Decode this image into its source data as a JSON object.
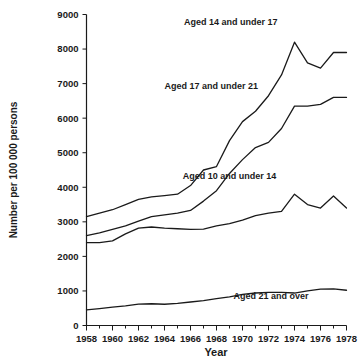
{
  "chart_data": {
    "type": "line",
    "title": "",
    "xlabel": "Year",
    "ylabel": "Number per 100 000 persons",
    "xlim": [
      1958,
      1978
    ],
    "ylim": [
      0,
      9000
    ],
    "grid": false,
    "legend_position": "inline-annotations",
    "x": [
      1958,
      1959,
      1960,
      1961,
      1962,
      1963,
      1964,
      1965,
      1966,
      1967,
      1968,
      1969,
      1970,
      1971,
      1972,
      1973,
      1974,
      1975,
      1976,
      1977,
      1978
    ],
    "xticks_major": [
      1958,
      1960,
      1962,
      1964,
      1966,
      1968,
      1970,
      1972,
      1974,
      1976,
      1978
    ],
    "xtick_labels": [
      "1958",
      "1960",
      "1962",
      "1964",
      "1966",
      "1968",
      "1970",
      "1972",
      "1974",
      "1976",
      "1978"
    ],
    "xticks_minor": [
      1959,
      1961,
      1963,
      1965,
      1967,
      1969,
      1971,
      1973,
      1975,
      1977
    ],
    "yticks": [
      0,
      1000,
      2000,
      3000,
      4000,
      5000,
      6000,
      7000,
      8000,
      9000
    ],
    "ytick_labels": [
      "0",
      "1000",
      "2000",
      "3000",
      "4000",
      "5000",
      "6000",
      "7000",
      "8000",
      "9000"
    ],
    "series": [
      {
        "name": "Aged 14 and under 17",
        "label": "Aged 14 and under 17",
        "label_x": 1969.1,
        "label_y": 8700,
        "values": [
          3150,
          3250,
          3350,
          3500,
          3650,
          3720,
          3760,
          3800,
          4050,
          4500,
          4600,
          5350,
          5900,
          6200,
          6650,
          7250,
          8200,
          7600,
          7450,
          7900,
          7900
        ]
      },
      {
        "name": "Aged 17 and under 21",
        "label": "Aged 17 and under 21",
        "label_x": 1967.6,
        "label_y": 6850,
        "values": [
          2600,
          2680,
          2780,
          2880,
          3020,
          3150,
          3200,
          3250,
          3330,
          3600,
          3900,
          4400,
          4800,
          5150,
          5300,
          5700,
          6350,
          6350,
          6400,
          6600,
          6600
        ]
      },
      {
        "name": "Aged 10 and under 14",
        "label": "Aged 10 and under 14",
        "label_x": 1969.0,
        "label_y": 4250,
        "values": [
          2400,
          2400,
          2450,
          2650,
          2820,
          2850,
          2820,
          2800,
          2780,
          2790,
          2880,
          2950,
          3050,
          3180,
          3250,
          3300,
          3800,
          3500,
          3400,
          3750,
          3400
        ]
      },
      {
        "name": "Aged 21 and over",
        "label": "Aged 21 and over",
        "label_x": 1972.2,
        "label_y": 760,
        "values": [
          450,
          490,
          530,
          570,
          620,
          630,
          615,
          640,
          680,
          720,
          780,
          830,
          900,
          940,
          960,
          960,
          940,
          1000,
          1050,
          1060,
          1020
        ]
      }
    ]
  },
  "colors": {
    "line": "#1a1a1a",
    "axis": "#1a1a1a",
    "background": "#ffffff"
  }
}
